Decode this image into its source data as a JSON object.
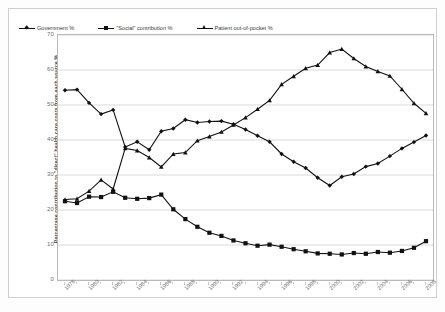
{
  "chart_data": {
    "type": "line",
    "title": "",
    "xlabel": "",
    "ylabel": "Percentage contribution to \"direct\" health care costs from each source %",
    "ylim": [
      0,
      70
    ],
    "ytick_step": 10,
    "yticks": [
      0,
      10,
      20,
      30,
      40,
      50,
      60,
      70
    ],
    "grid": true,
    "legend_position": "top-left-inside",
    "x": [
      1978,
      1979,
      1980,
      1981,
      1982,
      1983,
      1984,
      1985,
      1986,
      1987,
      1988,
      1989,
      1990,
      1991,
      1992,
      1993,
      1994,
      1995,
      1996,
      1997,
      1998,
      1999,
      2000,
      2001,
      2002,
      2003,
      2004,
      2005,
      2006,
      2007,
      2008
    ],
    "xtick_labels": [
      "1978",
      "1980",
      "1982",
      "1984",
      "1986",
      "1988",
      "1990",
      "1992",
      "1994",
      "1996",
      "1998",
      "2000",
      "2002",
      "2004",
      "2006",
      "2008"
    ],
    "xticks": [
      1978,
      1980,
      1982,
      1984,
      1986,
      1988,
      1990,
      1992,
      1994,
      1996,
      1998,
      2000,
      2002,
      2004,
      2006,
      2008
    ],
    "series": [
      {
        "name": "Government %",
        "marker": "diamond",
        "color": "#111111",
        "values": [
          54.2,
          54.4,
          50.6,
          47.4,
          48.6,
          38.0,
          39.5,
          37.2,
          42.5,
          43.3,
          45.8,
          45.0,
          45.3,
          45.4,
          44.5,
          43.0,
          41.2,
          39.5,
          36.0,
          33.8,
          32.0,
          29.2,
          27.0,
          29.5,
          30.3,
          32.4,
          33.3,
          35.4,
          37.6,
          39.4,
          41.3
        ]
      },
      {
        "name": "\"Social\" contribution %",
        "marker": "square",
        "color": "#111111",
        "values": [
          22.5,
          22.0,
          23.8,
          23.7,
          25.2,
          23.5,
          23.2,
          23.4,
          24.4,
          20.2,
          17.4,
          15.2,
          13.5,
          12.6,
          11.3,
          10.5,
          9.8,
          10.1,
          9.5,
          8.8,
          8.2,
          7.6,
          7.5,
          7.3,
          7.7,
          7.5,
          8.0,
          7.8,
          8.3,
          9.2,
          11.1
        ]
      },
      {
        "name": "Patient out-of-pocket %",
        "marker": "triangle",
        "color": "#111111",
        "values": [
          23.0,
          23.2,
          25.4,
          28.6,
          26.0,
          37.6,
          37.0,
          35.0,
          32.3,
          36.0,
          36.4,
          39.8,
          41.0,
          42.3,
          44.3,
          46.4,
          48.8,
          51.3,
          55.9,
          58.2,
          60.5,
          61.4,
          65.0,
          66.0,
          63.3,
          61.0,
          59.6,
          58.3,
          54.5,
          50.5,
          47.6
        ]
      }
    ]
  },
  "axis": {
    "y_title": "Percentage contribution to \"direct\" health care costs from each source %"
  },
  "legend": {
    "items": [
      {
        "label": "Government %",
        "marker": "diamond"
      },
      {
        "label": "\"Social\" contribution %",
        "marker": "square"
      },
      {
        "label": "Patient out-of-pocket %",
        "marker": "triangle"
      }
    ]
  }
}
